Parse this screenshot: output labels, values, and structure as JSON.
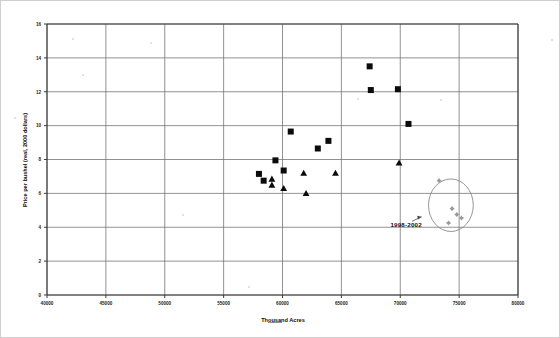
{
  "chart_data": {
    "type": "scatter",
    "title": "",
    "xlabel": "Thousand Acres",
    "ylabel": "Price per bushel (real, 2000 dollars)",
    "xlim": [
      40000,
      80000
    ],
    "ylim": [
      0,
      16
    ],
    "xticks": [
      40000,
      45000,
      50000,
      55000,
      60000,
      65000,
      70000,
      75000,
      80000
    ],
    "yticks": [
      0,
      2,
      4,
      6,
      8,
      10,
      12,
      14,
      16
    ],
    "xtick_labels": [
      "40000",
      "45000",
      "50000",
      "55000",
      "60000",
      "65000",
      "70000",
      "75000",
      "80000"
    ],
    "ytick_labels": [
      "0",
      "2",
      "4",
      "6",
      "8",
      "10",
      "12",
      "14",
      "16"
    ],
    "grid": true,
    "legend": "none",
    "annotations": [
      {
        "text": "1998-2002",
        "x": 70500,
        "y": 4.0,
        "points_to_x": 73000,
        "points_to_y": 4.5
      }
    ],
    "highlight_region": {
      "shape": "ellipse",
      "center_x": 74300,
      "center_y": 5.3,
      "radius_x": 1900,
      "radius_y": 1.55
    },
    "series": [
      {
        "name": "squares",
        "marker": "square",
        "color": "#0b0b0b",
        "points": [
          [
            58000,
            7.15
          ],
          [
            58400,
            6.75
          ],
          [
            59400,
            7.95
          ],
          [
            60100,
            7.35
          ],
          [
            60700,
            9.65
          ],
          [
            63000,
            8.65
          ],
          [
            63900,
            9.1
          ],
          [
            67400,
            13.5
          ],
          [
            67500,
            12.1
          ],
          [
            69800,
            12.15
          ],
          [
            70700,
            10.1
          ]
        ]
      },
      {
        "name": "triangles",
        "marker": "triangle",
        "color": "#0b0b0b",
        "points": [
          [
            59100,
            6.85
          ],
          [
            59100,
            6.5
          ],
          [
            60100,
            6.3
          ],
          [
            61800,
            7.2
          ],
          [
            62000,
            6.0
          ],
          [
            64500,
            7.2
          ],
          [
            69900,
            7.8
          ]
        ]
      },
      {
        "name": "1998-2002",
        "marker": "diamond",
        "color": "#9a9a9a",
        "points": [
          [
            73300,
            6.75
          ],
          [
            74400,
            5.1
          ],
          [
            74800,
            4.75
          ],
          [
            75200,
            4.55
          ],
          [
            74100,
            4.25
          ]
        ]
      }
    ]
  }
}
